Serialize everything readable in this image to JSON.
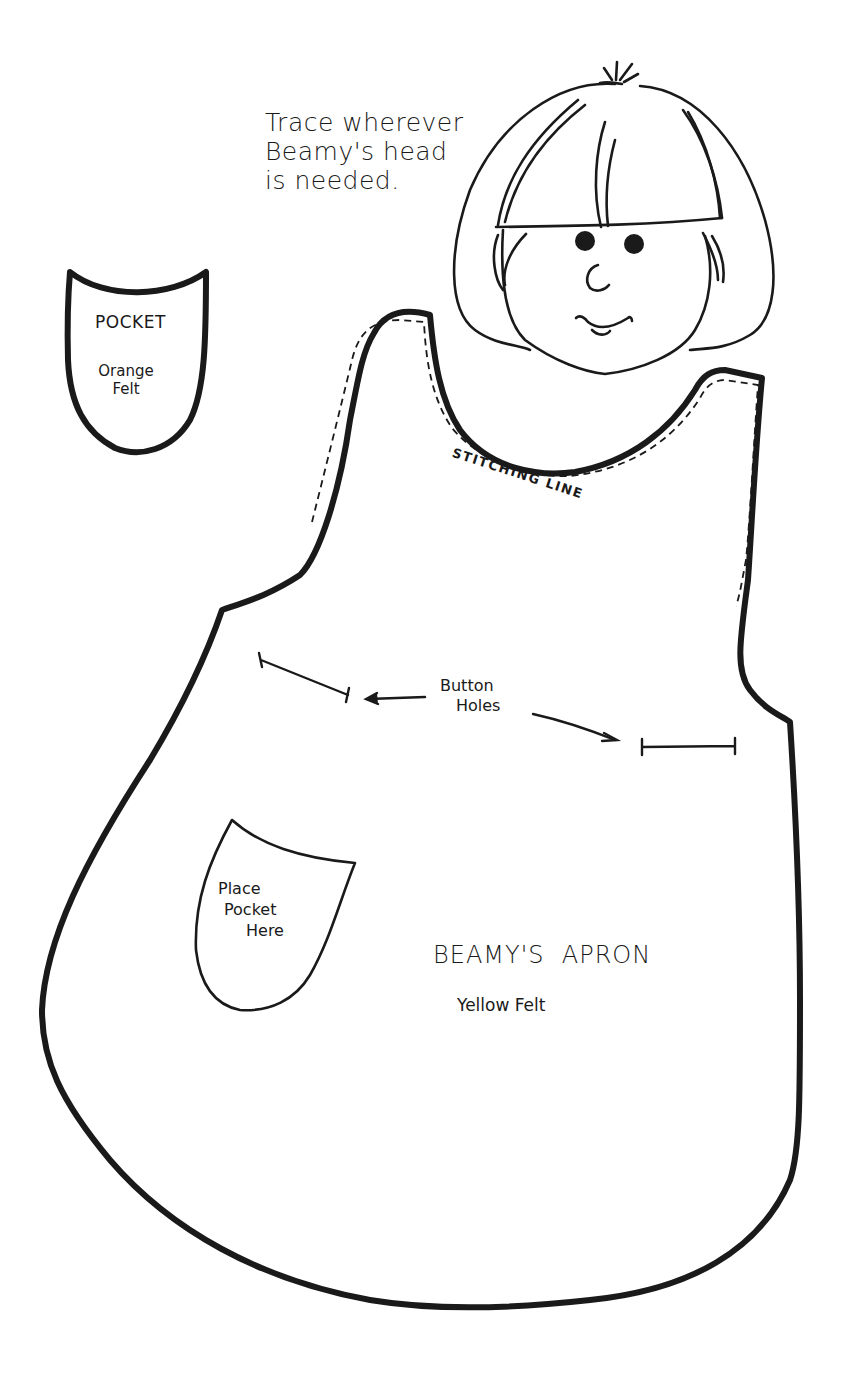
{
  "head_note": {
    "lines": [
      "Trace wherever",
      "Beamy's head",
      "is needed."
    ]
  },
  "pocket_piece": {
    "title": "POCKET",
    "material_lines": [
      "Orange",
      "Felt"
    ]
  },
  "apron_piece": {
    "stitching_label": "STITCHING LINE",
    "button_holes_lines": [
      "Button",
      "Holes"
    ],
    "pocket_placement_lines": [
      "Place",
      "Pocket",
      "Here"
    ],
    "title": "BEAMY'S  APRON",
    "material": "Yellow Felt"
  },
  "colors": {
    "ink": "#1a1a1a",
    "paper": "#ffffff"
  }
}
